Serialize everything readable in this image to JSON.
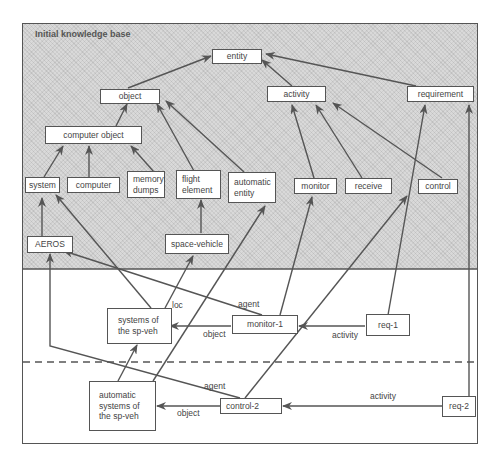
{
  "diagram": {
    "title": "Initial knowledge base",
    "nodes": {
      "entity": "entity",
      "object": "object",
      "activity": "activity",
      "requirement": "requirement",
      "computer_object": "computer object",
      "system": "system",
      "computer": "computer",
      "memory_dumps": "memory\ndumps",
      "flight_element": "flight\nelement",
      "automatic_entity": "automatic\nentity",
      "monitor": "monitor",
      "receive": "receive",
      "control": "control",
      "aeros": "AEROS",
      "space_vehicle": "space-vehicle",
      "systems_of_sp_veh": "systems of\nthe sp-veh",
      "monitor_1": "monitor-1",
      "req_1": "req-1",
      "automatic_systems": "automatic\nsystems of\nthe sp-veh",
      "control_2": "control-2",
      "req_2": "req-2"
    },
    "edge_labels": {
      "loc": "loc",
      "agent_1": "agent",
      "object_1": "object",
      "activity_1": "activity",
      "agent_2": "agent",
      "object_2": "object",
      "activity_2": "activity"
    },
    "edges": [
      {
        "from": "object",
        "to": "entity"
      },
      {
        "from": "activity",
        "to": "entity"
      },
      {
        "from": "requirement",
        "to": "entity"
      },
      {
        "from": "computer_object",
        "to": "object"
      },
      {
        "from": "flight_element",
        "to": "object"
      },
      {
        "from": "automatic_entity",
        "to": "object"
      },
      {
        "from": "system",
        "to": "computer_object"
      },
      {
        "from": "computer",
        "to": "computer_object"
      },
      {
        "from": "memory_dumps",
        "to": "computer_object"
      },
      {
        "from": "monitor",
        "to": "activity"
      },
      {
        "from": "receive",
        "to": "activity"
      },
      {
        "from": "control",
        "to": "activity"
      },
      {
        "from": "aeros",
        "to": "system"
      },
      {
        "from": "space_vehicle",
        "to": "flight_element"
      },
      {
        "from": "systems_of_sp_veh",
        "to": "system"
      },
      {
        "from": "systems_of_sp_veh",
        "to": "space_vehicle",
        "label": "loc"
      },
      {
        "from": "monitor_1",
        "to": "aeros",
        "label": "agent"
      },
      {
        "from": "monitor_1",
        "to": "monitor"
      },
      {
        "from": "monitor_1",
        "to": "systems_of_sp_veh",
        "label": "object"
      },
      {
        "from": "req_1",
        "to": "monitor_1",
        "label": "activity"
      },
      {
        "from": "req_1",
        "to": "requirement"
      },
      {
        "from": "automatic_systems",
        "to": "systems_of_sp_veh"
      },
      {
        "from": "automatic_systems",
        "to": "automatic_entity"
      },
      {
        "from": "control_2",
        "to": "aeros",
        "label": "agent"
      },
      {
        "from": "control_2",
        "to": "control"
      },
      {
        "from": "control_2",
        "to": "automatic_systems",
        "label": "object"
      },
      {
        "from": "req_2",
        "to": "control_2",
        "label": "activity"
      },
      {
        "from": "req_2",
        "to": "requirement"
      }
    ],
    "colors": {
      "line": "#555555",
      "shaded_region": "#d9d9d9",
      "box_fill": "#ffffff"
    }
  }
}
